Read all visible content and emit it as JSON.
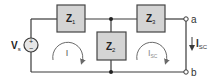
{
  "diagram": {
    "colors": {
      "wire": "#3a3a3a",
      "box_fill": "#d4d4d4",
      "box_stroke": "#444444",
      "loop_arrow": "#6a6a6a",
      "loop_label": "#555555",
      "isc_loop_label": "#8a8a8a",
      "background": "#ffffff"
    },
    "source": {
      "label": "V",
      "subscript": "s",
      "plus": "+",
      "minus": "−"
    },
    "impedances": [
      {
        "id": "Z1",
        "label": "Z",
        "subscript": "1"
      },
      {
        "id": "Z2",
        "label": "Z",
        "subscript": "2"
      },
      {
        "id": "Z3",
        "label": "Z",
        "subscript": "3"
      }
    ],
    "loops": [
      {
        "id": "loop-I",
        "label": "I",
        "subscript": "",
        "direction": "clockwise"
      },
      {
        "id": "loop-Isc",
        "label": "I",
        "subscript": "SC",
        "direction": "clockwise"
      }
    ],
    "terminals": [
      {
        "id": "a",
        "label": "a"
      },
      {
        "id": "b",
        "label": "b"
      }
    ],
    "short_circuit_current": {
      "label": "I",
      "subscript": "SC",
      "direction": "down"
    }
  }
}
